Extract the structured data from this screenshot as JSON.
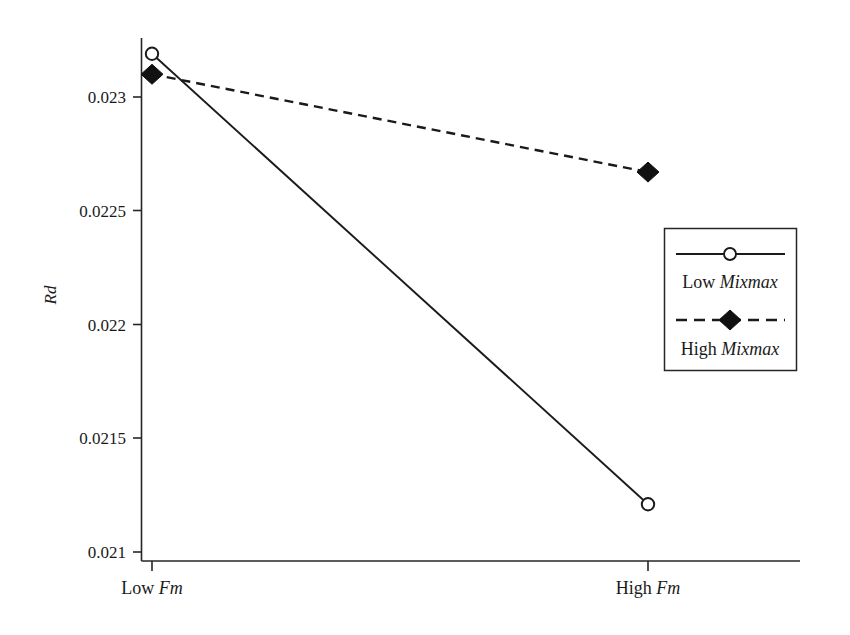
{
  "chart_data": {
    "type": "line",
    "title": "",
    "subtitle": "",
    "xlabel": "Fm",
    "ylabel": "Rd",
    "categories": [
      "Low Fm",
      "High Fm"
    ],
    "x": [
      0,
      1
    ],
    "xlim": [
      -0.05,
      1.05
    ],
    "ylim": [
      0.021,
      0.02335
    ],
    "yticks": [
      "0.023",
      "0.0225",
      "0.022",
      "0.0215",
      "0.021"
    ],
    "ytick_values": [
      0.023,
      0.0225,
      0.022,
      0.0215,
      0.021
    ],
    "grid": false,
    "legend_position": "right",
    "series": [
      {
        "name": "Low Mixmax",
        "name_prefix": "Low",
        "name_emphasis": "Mixmax",
        "values": [
          0.02319,
          0.02121
        ],
        "marker": "open-circle",
        "linestyle": "solid",
        "color": "#1a1a1a"
      },
      {
        "name": "High Mixmax",
        "name_prefix": "High",
        "name_emphasis": "Mixmax",
        "values": [
          0.0231,
          0.02267
        ],
        "marker": "filled-diamond",
        "linestyle": "dashed",
        "color": "#1a1a1a"
      }
    ],
    "annotations": []
  },
  "axes": {
    "y_title": "Rd",
    "y_tick_0": "0.023",
    "y_tick_1": "0.0225",
    "y_tick_2": "0.022",
    "y_tick_3": "0.0215",
    "y_tick_4": "0.021",
    "x_cat_0_prefix": "Low",
    "x_cat_0_emphasis": "Fm",
    "x_cat_1_prefix": "High",
    "x_cat_1_emphasis": "Fm"
  },
  "legend": {
    "entry_0_prefix": "Low",
    "entry_0_emphasis": "Mixmax",
    "entry_1_prefix": "High",
    "entry_1_emphasis": "Mixmax"
  },
  "colors": {
    "ink": "#1a1a1a",
    "line": "#262626",
    "background": "#ffffff"
  }
}
